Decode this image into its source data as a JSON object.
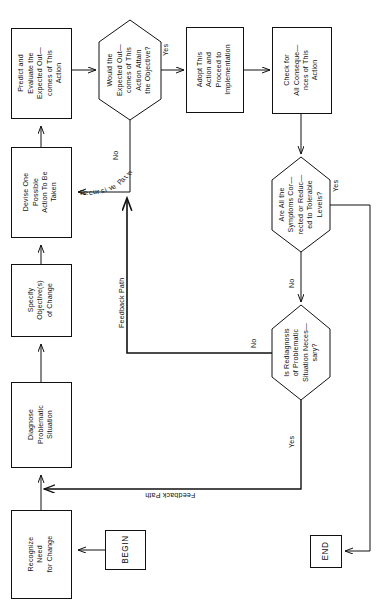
{
  "diagram": {
    "orientation": "landscape-rotated-90ccw",
    "page_size": {
      "width": 383,
      "height": 606
    },
    "ink_color": "#111111",
    "background_color": "#ffffff"
  },
  "terminals": {
    "begin": "BEGIN",
    "end": "END"
  },
  "process_nodes": [
    {
      "id": "recognize",
      "label": "Recognize\nNeed\nfor Change"
    },
    {
      "id": "diagnose",
      "label": "Diagnose\nProblematic\nSituation"
    },
    {
      "id": "specify",
      "label": "Specify\nObjective(s)\nof Change"
    },
    {
      "id": "devise",
      "label": "Devise One\nPossible\nAction To Be\nTaken"
    },
    {
      "id": "predict",
      "label": "Predict and\nEvaluate the\nExpected Out—\ncomes of This\nAction"
    },
    {
      "id": "adopt",
      "label": "Adopt This\nAction and\nProceed to\nImplementation"
    },
    {
      "id": "check",
      "label": "Check for\nAll Conseque—\nnces of This\nAction"
    }
  ],
  "decision_nodes": [
    {
      "id": "attain",
      "label": "Would the\nExpected Out—\ncomes of This\nAction Attain\nthe Objective?"
    },
    {
      "id": "symptoms",
      "label": "Are All the\nSymptoms Cor—\nrected or Reduc—\ned to Tolerable\nLevels?"
    },
    {
      "id": "rediagnosis",
      "label": "Is Rediagnosis\nof Problematic\nSituation Neces—\nsary?"
    }
  ],
  "edge_labels": {
    "attain_yes": "Yes",
    "attain_no": "No",
    "recursive_path": "Recursive Path",
    "recursive_path_chars": [
      "R",
      "e",
      "c",
      "u",
      "r",
      "s",
      "i",
      "v",
      "e",
      " ",
      "P",
      "a",
      "t",
      "h"
    ],
    "symptoms_yes": "Yes",
    "symptoms_no": "No",
    "rediagnosis_no": "No",
    "rediagnosis_yes": "Yes",
    "feedback_path_upper": "Feedback Path",
    "feedback_path_lower": "Feedback Path"
  }
}
